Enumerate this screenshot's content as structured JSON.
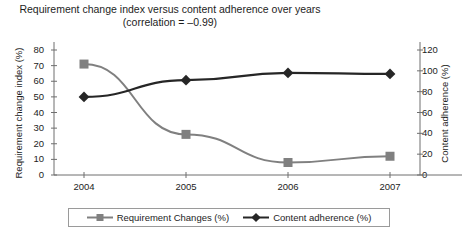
{
  "chart_data": {
    "type": "line",
    "title": "Requirement change index versus content adherence over years",
    "subtitle": "(correlation = –0.99)",
    "xlabel": "",
    "categories": [
      "2004",
      "2005",
      "2006",
      "2007"
    ],
    "grid": false,
    "legend_position": "bottom",
    "series": [
      {
        "name": "Requirement Changes (%)",
        "axis": "left",
        "marker": "square",
        "color": "#808080",
        "values": [
          71,
          26,
          8,
          12
        ]
      },
      {
        "name": "Content adherence (%)",
        "axis": "right",
        "marker": "diamond",
        "color": "#262626",
        "values": [
          75,
          91,
          98,
          97
        ]
      }
    ],
    "axes": {
      "left": {
        "label": "Requirement change index (%)",
        "ticks": [
          0,
          10,
          20,
          30,
          40,
          50,
          60,
          70,
          80
        ],
        "ylim": [
          0,
          80
        ]
      },
      "right": {
        "label": "Content adherence (%)",
        "ticks": [
          0,
          20,
          40,
          60,
          80,
          100,
          120
        ],
        "ylim": [
          0,
          120
        ]
      }
    }
  },
  "colors": {
    "series_requirement": "#808080",
    "series_adherence": "#262626",
    "axis": "#6e6e6e",
    "text": "#1d1d1d",
    "legend_border": "#9a9a9a"
  }
}
